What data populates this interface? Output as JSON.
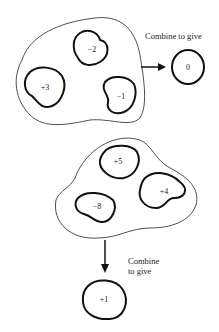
{
  "diagram": {
    "group_top": {
      "charges": [
        "−2",
        "+3",
        "−1"
      ],
      "caption": "Combine to give",
      "result": "0"
    },
    "group_bottom": {
      "charges": [
        "+5",
        "+4",
        "−8"
      ],
      "caption_line1": "Combine",
      "caption_line2": "to give",
      "result": "+1"
    }
  }
}
